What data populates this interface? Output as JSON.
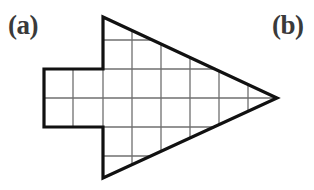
{
  "figure": {
    "background_color": "#ffffff",
    "outline_color": "#111111",
    "grid_color": "#6f6f6f",
    "label_color": "#3a3a3a",
    "outline_width": 3.2,
    "grid_width": 1.3,
    "labels": [
      {
        "id": "a",
        "text": "(a)",
        "x": 8,
        "y": 12
      },
      {
        "id": "b",
        "text": "(b)",
        "x": 272,
        "y": 12
      }
    ],
    "shape": {
      "name": "arrow-mesh",
      "description": "Triangular arrowhead with rectangular tail, overlaid with a square mesh",
      "triangle": {
        "apex_top": [
          103,
          17
        ],
        "apex_bottom": [
          103,
          178
        ],
        "tip_right": [
          277,
          98
        ]
      },
      "tail_rect": {
        "left": 44,
        "top": 69,
        "right": 103,
        "bottom": 127
      },
      "outline_path": "M 103 17 L 277 98 L 103 178 L 103 127 L 44 127 L 44 69 L 103 69 Z"
    },
    "mesh": {
      "cell_size": 29,
      "vertical_lines_x": [
        44,
        73,
        103,
        132,
        161,
        190,
        219,
        248
      ],
      "horizontal_lines_y": [
        40,
        69,
        98,
        127,
        156
      ],
      "x_origin": 103,
      "y_origin": 98
    }
  }
}
